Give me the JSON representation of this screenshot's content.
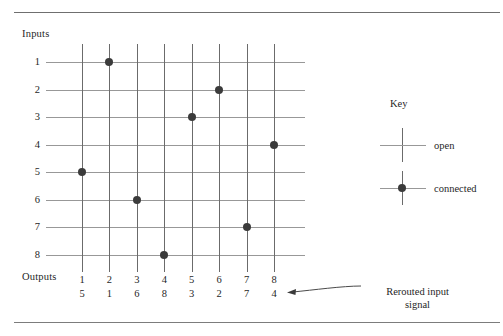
{
  "figure": {
    "inputs_label": "Inputs",
    "outputs_label": "Outputs",
    "input_labels": [
      "1",
      "2",
      "3",
      "4",
      "5",
      "6",
      "7",
      "8"
    ],
    "output_labels": [
      "1",
      "2",
      "3",
      "4",
      "5",
      "6",
      "7",
      "8"
    ],
    "output_source_labels": [
      "5",
      "1",
      "6",
      "8",
      "3",
      "2",
      "7",
      "4"
    ],
    "annotation": {
      "line1": "Rerouted input",
      "line2": "signal"
    }
  },
  "key": {
    "title": "Key",
    "open_label": "open",
    "connected_label": "connected"
  },
  "colors": {
    "dot": "#3b3b3b",
    "h_line": "#989898",
    "v_line": "#6b6b6b",
    "rule": "#7c7c7c",
    "text": "#1f1f1f",
    "background": "#ffffff"
  },
  "chart_data": {
    "type": "heatmap",
    "title": "",
    "xlabel": "Outputs",
    "ylabel": "Inputs",
    "categories": [
      "1",
      "2",
      "3",
      "4",
      "5",
      "6",
      "7",
      "8"
    ],
    "x": [
      "1",
      "2",
      "3",
      "4",
      "5",
      "6",
      "7",
      "8"
    ],
    "y": [
      "1",
      "2",
      "3",
      "4",
      "5",
      "6",
      "7",
      "8"
    ],
    "grid": true,
    "legend_position": "right",
    "connections": [
      {
        "input": 1,
        "output": 2
      },
      {
        "input": 2,
        "output": 6
      },
      {
        "input": 3,
        "output": 5
      },
      {
        "input": 4,
        "output": 8
      },
      {
        "input": 5,
        "output": 1
      },
      {
        "input": 6,
        "output": 3
      },
      {
        "input": 7,
        "output": 7
      },
      {
        "input": 8,
        "output": 4
      }
    ],
    "matrix": [
      [
        0,
        1,
        0,
        0,
        0,
        0,
        0,
        0
      ],
      [
        0,
        0,
        0,
        0,
        0,
        1,
        0,
        0
      ],
      [
        0,
        0,
        0,
        0,
        1,
        0,
        0,
        0
      ],
      [
        0,
        0,
        0,
        0,
        0,
        0,
        0,
        1
      ],
      [
        1,
        0,
        0,
        0,
        0,
        0,
        0,
        0
      ],
      [
        0,
        0,
        1,
        0,
        0,
        0,
        0,
        0
      ],
      [
        0,
        0,
        0,
        0,
        0,
        0,
        1,
        0
      ],
      [
        0,
        0,
        0,
        1,
        0,
        0,
        0,
        0
      ]
    ],
    "output_to_input_map": [
      5,
      1,
      6,
      8,
      3,
      2,
      7,
      4
    ],
    "legend_entries": [
      "open",
      "connected"
    ]
  },
  "geometry": {
    "col_x": [
      82,
      109.4,
      136.9,
      164.3,
      191.7,
      219.1,
      246.6,
      274
    ],
    "row_y": [
      62,
      89.6,
      117.1,
      144.7,
      172.3,
      199.9,
      227.4,
      255
    ],
    "h_line_start": 46,
    "h_line_end": 305,
    "v_line_top": 44,
    "v_line_bottom": 272
  }
}
